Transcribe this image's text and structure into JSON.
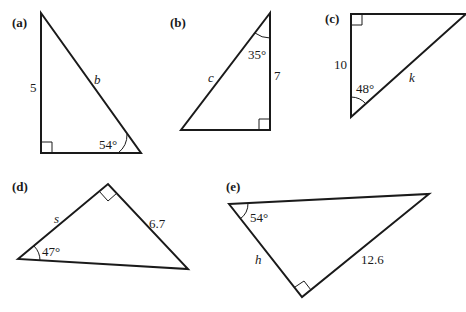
{
  "figure": {
    "triangles": [
      {
        "part_label": "(a)",
        "side_label": "5",
        "unknown_label": "b",
        "angle_label": "54°",
        "right_angle": true
      },
      {
        "part_label": "(b)",
        "side_label": "7",
        "unknown_label": "c",
        "angle_label": "35°",
        "right_angle": true
      },
      {
        "part_label": "(c)",
        "side_label": "10",
        "unknown_label": "k",
        "angle_label": "48°",
        "right_angle": true
      },
      {
        "part_label": "(d)",
        "side_label": "6.7",
        "unknown_label": "s",
        "angle_label": "47°",
        "right_angle": true
      },
      {
        "part_label": "(e)",
        "side_label": "12.6",
        "unknown_label": "h",
        "angle_label": "54°",
        "right_angle": true
      }
    ]
  }
}
